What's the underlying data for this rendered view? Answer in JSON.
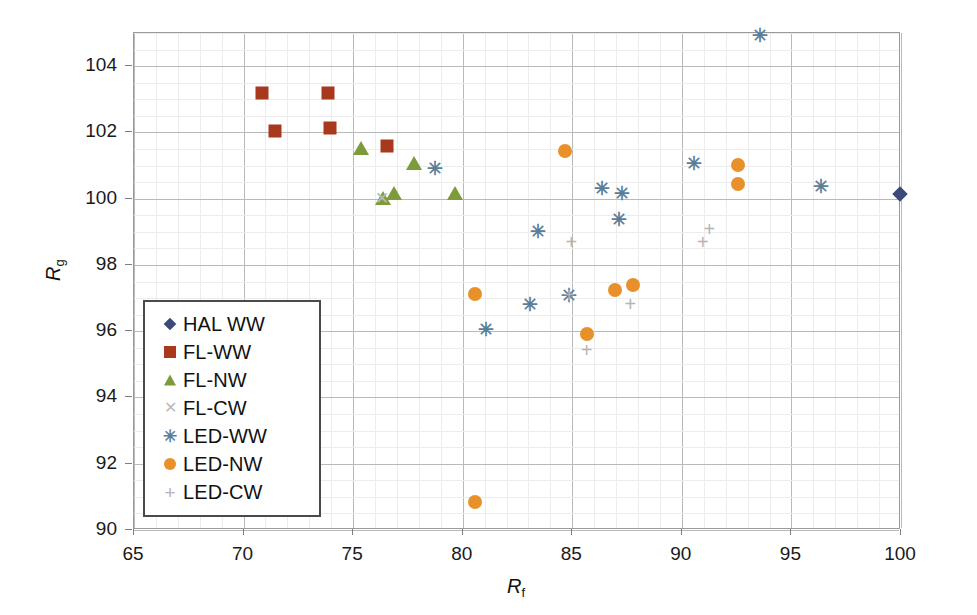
{
  "chart_data": {
    "type": "scatter",
    "title": "",
    "xlabel": "Rf",
    "ylabel": "Rg",
    "xlim": [
      65,
      100
    ],
    "ylim": [
      90,
      105
    ],
    "xticks": [
      65,
      70,
      75,
      80,
      85,
      90,
      95,
      100
    ],
    "yticks": [
      90,
      92,
      94,
      96,
      98,
      100,
      102,
      104
    ],
    "grid": true,
    "x_minor_step": 1,
    "y_minor_step": 0.5,
    "legend_position": "lower-left-inside",
    "series": [
      {
        "name": "HAL WW",
        "marker": "diamond",
        "color": "#3b4a7a",
        "points": [
          [
            100.0,
            100.1
          ]
        ]
      },
      {
        "name": "FL-WW",
        "marker": "square",
        "color": "#a8391c",
        "points": [
          [
            70.9,
            103.15
          ],
          [
            71.5,
            102.0
          ],
          [
            73.9,
            103.15
          ],
          [
            74.0,
            102.1
          ],
          [
            76.6,
            101.55
          ]
        ]
      },
      {
        "name": "FL-NW",
        "marker": "triangle",
        "color": "#7c9b3a",
        "points": [
          [
            75.4,
            101.5
          ],
          [
            76.4,
            100.0
          ],
          [
            76.9,
            100.15
          ],
          [
            77.8,
            101.05
          ],
          [
            79.7,
            100.15
          ]
        ]
      },
      {
        "name": "FL-CW",
        "marker": "x",
        "color": "#b9b9b9",
        "points": [
          [
            76.35,
            100.0
          ]
        ]
      },
      {
        "name": "LED-WW",
        "marker": "star",
        "color": "#5b7d98",
        "points": [
          [
            78.8,
            100.9
          ],
          [
            83.5,
            99.0
          ],
          [
            83.1,
            96.8
          ],
          [
            81.1,
            96.05
          ],
          [
            84.9,
            97.05
          ],
          [
            86.4,
            100.3
          ],
          [
            87.3,
            100.15
          ],
          [
            87.2,
            99.35
          ],
          [
            90.6,
            101.05
          ],
          [
            93.6,
            104.9
          ],
          [
            96.4,
            100.35
          ]
        ]
      },
      {
        "name": "LED-NW",
        "marker": "circle",
        "color": "#e8912a",
        "points": [
          [
            80.6,
            97.1
          ],
          [
            80.6,
            90.8
          ],
          [
            84.7,
            101.4
          ],
          [
            85.7,
            95.9
          ],
          [
            87.0,
            97.2
          ],
          [
            87.8,
            97.35
          ],
          [
            92.6,
            101.0
          ],
          [
            92.6,
            100.4
          ]
        ]
      },
      {
        "name": "LED-CW",
        "marker": "plus",
        "color": "#b5b5b5",
        "points": [
          [
            85.0,
            98.65
          ],
          [
            85.7,
            95.4
          ],
          [
            84.9,
            97.05
          ],
          [
            87.7,
            96.8
          ],
          [
            91.3,
            99.05
          ],
          [
            91.0,
            98.65
          ]
        ]
      }
    ]
  },
  "axes": {
    "x_title_main": "R",
    "x_title_sub": "f",
    "y_title_main": "R",
    "y_title_sub": "g"
  },
  "legend": {
    "items": [
      {
        "label": "HAL WW",
        "marker": "diamond",
        "color": "#3b4a7a"
      },
      {
        "label": "FL-WW",
        "marker": "square",
        "color": "#a8391c"
      },
      {
        "label": "FL-NW",
        "marker": "triangle",
        "color": "#7c9b3a"
      },
      {
        "label": "FL-CW",
        "marker": "x",
        "color": "#b9b9b9"
      },
      {
        "label": "LED-WW",
        "marker": "star",
        "color": "#5b7d98"
      },
      {
        "label": "LED-NW",
        "marker": "circle",
        "color": "#e8912a"
      },
      {
        "label": "LED-CW",
        "marker": "plus",
        "color": "#b5b5b5"
      }
    ]
  }
}
